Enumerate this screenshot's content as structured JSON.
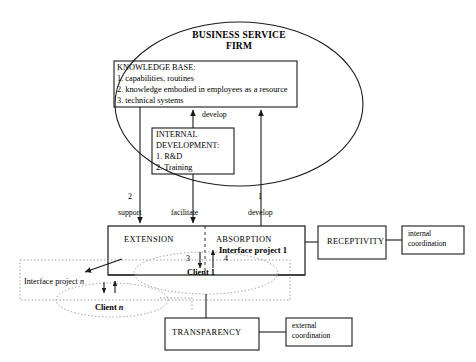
{
  "diagram": {
    "firm": {
      "line1": "BUSINESS SERVICE",
      "line2": "FIRM"
    },
    "knowledge_base": {
      "heading": "KNOWLEDGE BASE:",
      "items": [
        "1. capabilities, routines",
        "2. knowledge embodied in employees as a resource",
        "3. technical systems"
      ]
    },
    "internal_development": {
      "heading_line1": "INTERNAL",
      "heading_line2": "DEVELOPMENT:",
      "items": [
        "1. R&D",
        "2. Training"
      ]
    },
    "flows": {
      "develop_internal": "develop",
      "support_number": "2",
      "support_label": "support",
      "facilitate_label": "facilitate",
      "develop_number": "1",
      "develop_label": "develop",
      "arrow_three": "3",
      "arrow_four": "4"
    },
    "interface_box": {
      "extension": "EXTENSION",
      "absorption": "ABSORPTION",
      "project_label": "Interface project 1"
    },
    "receptivity": {
      "label": "RECEPTIVITY"
    },
    "internal_coordination": {
      "line1": "internal",
      "line2": "coordination"
    },
    "transparency": {
      "label": "TRANSPARENCY"
    },
    "external_coordination": {
      "line1": "external",
      "line2": "coordination"
    },
    "clients": {
      "client_one": "Client 1",
      "client_n_prefix": "Client ",
      "client_n_suffix": "n",
      "interface_project_n_prefix": "Interface project ",
      "interface_project_n_suffix": "n"
    },
    "colors": {
      "stroke": "#1a1a1a",
      "dotted": "#8a8a8a",
      "background": "#ffffff",
      "text": "#000000"
    }
  }
}
